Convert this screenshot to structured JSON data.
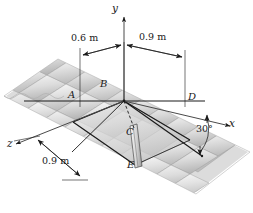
{
  "figure": {
    "type": "engineering-mechanics-diagram",
    "background_color": "#ffffff",
    "line_color": "#1a1a1a",
    "tile_fill": "#d9d9d9",
    "tile_highlight": "#f2f2f2",
    "tile_shadow": "#b3b3b3",
    "panel_fill": "#cfcfcf"
  },
  "axes": {
    "y_label": "y",
    "x_label": "x",
    "z_label": "z"
  },
  "points": {
    "a": "A",
    "b": "B",
    "c": "C",
    "d": "D",
    "e": "E"
  },
  "dimensions": {
    "top_left": "0.6 m",
    "top_right": "0.9 m",
    "bottom_left": "0.9 m",
    "angle": "30°"
  }
}
